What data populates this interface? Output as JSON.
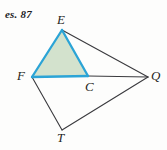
{
  "figure": {
    "exercise_tag": "es. 87",
    "background_color": "#fdfdfc",
    "width": 167,
    "height": 150
  },
  "colors": {
    "shaded_triangle_fill": "#d3e2cd",
    "shaded_triangle_stroke": "#2ba4d6",
    "plain_line_stroke": "#3a3a3e",
    "label_color": "#1f1f22"
  },
  "vertices": [
    {
      "id": "E",
      "label": "E",
      "x": 62,
      "y": 30,
      "label_x": 57,
      "label_y": 13
    },
    {
      "id": "F",
      "label": "F",
      "x": 32,
      "y": 77,
      "label_x": 17,
      "label_y": 69
    },
    {
      "id": "C",
      "label": "C",
      "x": 88,
      "y": 76,
      "label_x": 85,
      "label_y": 80
    },
    {
      "id": "Q",
      "label": "Q",
      "x": 148,
      "y": 77,
      "label_x": 151,
      "label_y": 69
    },
    {
      "id": "T",
      "label": "T",
      "x": 62,
      "y": 130,
      "label_x": 57,
      "label_y": 131
    }
  ],
  "shaded_polygon": {
    "name": "triangle-EFC",
    "points": "62,30 32,77 88,76",
    "vertices": [
      "E",
      "F",
      "C"
    ]
  },
  "segments": [
    {
      "name": "segment-E-Q",
      "from": "E",
      "to": "Q",
      "x1": 62,
      "y1": 30,
      "x2": 148,
      "y2": 77,
      "style": "plain"
    },
    {
      "name": "segment-C-Q",
      "from": "C",
      "to": "Q",
      "x1": 88,
      "y1": 76,
      "x2": 148,
      "y2": 77,
      "style": "plain"
    },
    {
      "name": "segment-F-T",
      "from": "F",
      "to": "T",
      "x1": 32,
      "y1": 77,
      "x2": 62,
      "y2": 130,
      "style": "plain"
    },
    {
      "name": "segment-T-Q",
      "from": "T",
      "to": "Q",
      "x1": 62,
      "y1": 130,
      "x2": 148,
      "y2": 77,
      "style": "plain"
    },
    {
      "name": "segment-E-F",
      "from": "E",
      "to": "F",
      "x1": 62,
      "y1": 30,
      "x2": 32,
      "y2": 77,
      "style": "highlight"
    },
    {
      "name": "segment-E-C",
      "from": "E",
      "to": "C",
      "x1": 62,
      "y1": 30,
      "x2": 88,
      "y2": 76,
      "style": "highlight"
    },
    {
      "name": "segment-F-C",
      "from": "F",
      "to": "C",
      "x1": 32,
      "y1": 77,
      "x2": 88,
      "y2": 76,
      "style": "highlight"
    }
  ]
}
